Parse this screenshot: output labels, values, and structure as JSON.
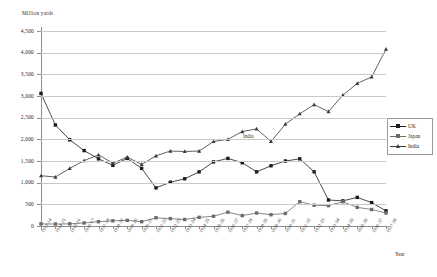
{
  "chart_data": {
    "type": "line",
    "title": "",
    "unit_label": "Million yards",
    "xlabel": "Year",
    "ylabel": "",
    "ylim": [
      0,
      4500
    ],
    "yticks": [
      0,
      500,
      1000,
      1500,
      2000,
      2500,
      3000,
      3500,
      4000,
      4500
    ],
    "ytick_labels": [
      "0",
      "500",
      "1,000",
      "1,500",
      "2,000",
      "2,500",
      "3,000",
      "3,500",
      "4,000",
      "4,500"
    ],
    "grid": true,
    "legend_position": "right",
    "categories": [
      "1913-14",
      "1914-15",
      "1915-16",
      "1916-17",
      "1917-18",
      "1918-19",
      "1919-20",
      "1920-21",
      "1921-22",
      "1922-23",
      "1923-24",
      "1924-25",
      "1925-26",
      "1926-27",
      "1927-28",
      "1928-29",
      "1929-30",
      "1930-31",
      "1931-32",
      "1932-33",
      "1933-34",
      "1934-35",
      "1935-36",
      "1936-37",
      "1937-38"
    ],
    "series": [
      {
        "name": "UK",
        "color": "#1c1c1c",
        "marker": "square",
        "values": [
          3060,
          2330,
          1990,
          1740,
          1550,
          1400,
          1560,
          1330,
          880,
          1010,
          1090,
          1250,
          1480,
          1560,
          1460,
          1250,
          1390,
          1500,
          1550,
          1250,
          600,
          580,
          660,
          540,
          350
        ]
      },
      {
        "name": "Japan",
        "color": "#6b6b6b",
        "marker": "square",
        "values": [
          50,
          45,
          50,
          70,
          100,
          120,
          130,
          100,
          190,
          170,
          150,
          200,
          225,
          320,
          240,
          300,
          260,
          290,
          560,
          480,
          470,
          560,
          430,
          380,
          300
        ]
      },
      {
        "name": "India",
        "color": "#3a3a3a",
        "marker": "triangle",
        "values": [
          1160,
          1130,
          1330,
          1510,
          1640,
          1450,
          1590,
          1420,
          1620,
          1730,
          1720,
          1730,
          1950,
          2000,
          2180,
          2240,
          1950,
          2350,
          2590,
          2800,
          2640,
          3020,
          3290,
          3440,
          4080
        ]
      }
    ],
    "annotations": [
      {
        "text": "India",
        "x_category": "1929-30",
        "y_value": 2050
      }
    ]
  }
}
